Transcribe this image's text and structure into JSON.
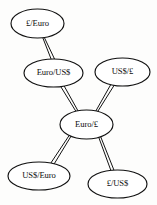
{
  "diagram": {
    "background_color": "#fdfdfc",
    "node_fill": "#ffffff",
    "node_stroke": "#111111",
    "edge_color": "#141414",
    "nodes": [
      {
        "id": "gbp-eur",
        "label": "£/Euro",
        "cx": 37.5,
        "cy": 23.5,
        "rx": 26.5,
        "ry": 14.5
      },
      {
        "id": "eur-usd",
        "label": "Euro/US$",
        "cx": 53.5,
        "cy": 73.0,
        "rx": 29.5,
        "ry": 14.0
      },
      {
        "id": "usd-gbp",
        "label": "US$/£",
        "cx": 122.5,
        "cy": 72.0,
        "rx": 27.5,
        "ry": 14.0
      },
      {
        "id": "eur-gbp",
        "label": "Euro/£",
        "cx": 86.5,
        "cy": 124.5,
        "rx": 26.5,
        "ry": 14.5
      },
      {
        "id": "usd-eur",
        "label": "US$/Euro",
        "cx": 39.0,
        "cy": 176.0,
        "rx": 31.0,
        "ry": 14.0
      },
      {
        "id": "gbp-usd",
        "label": "£/US$",
        "cx": 117.5,
        "cy": 184.0,
        "rx": 29.5,
        "ry": 14.0
      }
    ],
    "edges": [
      {
        "id": "edge-gbpeur-eurusd",
        "from": "gbp-eur",
        "to": "eur-usd",
        "x1": 43.5,
        "y1": 37.5,
        "x2": 53.0,
        "y2": 59.5,
        "w1": 1.5,
        "w2": 3.2
      },
      {
        "id": "edge-eurusd-eurgbp",
        "from": "eur-usd",
        "to": "eur-gbp",
        "x1": 62.0,
        "y1": 85.5,
        "x2": 77.5,
        "y2": 112.0,
        "w1": 3.3,
        "w2": 2.0
      },
      {
        "id": "edge-usdgbp-eurgbp",
        "from": "usd-gbp",
        "to": "eur-gbp",
        "x1": 113.0,
        "y1": 84.0,
        "x2": 96.0,
        "y2": 112.5,
        "w1": 3.3,
        "w2": 1.8
      },
      {
        "id": "edge-eurgbp-usdeur",
        "from": "eur-gbp",
        "to": "usd-eur",
        "x1": 70.0,
        "y1": 136.0,
        "x2": 52.5,
        "y2": 163.5,
        "w1": 2.0,
        "w2": 3.3
      },
      {
        "id": "edge-eurgbp-gbpusd",
        "from": "eur-gbp",
        "to": "gbp-usd",
        "x1": 99.5,
        "y1": 136.5,
        "x2": 112.5,
        "y2": 170.5,
        "w1": 2.0,
        "w2": 3.0
      }
    ]
  }
}
